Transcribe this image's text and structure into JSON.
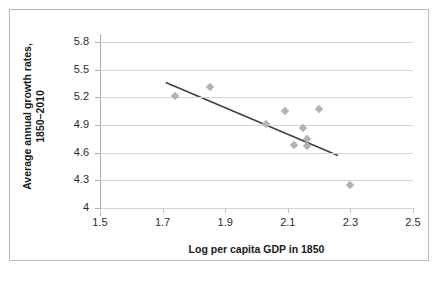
{
  "chart_data": {
    "type": "scatter",
    "title": "",
    "xlabel": "Log per capita GDP in 1850",
    "ylabel": "Average annual growth rates, 1850–2010",
    "ylabel_line1": "Average annual growth rates,",
    "ylabel_line2": "1850–2010",
    "xlim": [
      1.5,
      2.5
    ],
    "ylim": [
      4.0,
      5.8
    ],
    "xticks": [
      "1.5",
      "1.7",
      "1.9",
      "2.1",
      "2.3",
      "2.5"
    ],
    "xtick_values": [
      1.5,
      1.7,
      1.9,
      2.1,
      2.3,
      2.5
    ],
    "yticks": [
      "4",
      "4.3",
      "4.6",
      "4.9",
      "5.2",
      "5.5",
      "5.8"
    ],
    "ytick_values": [
      4.0,
      4.3,
      4.6,
      4.9,
      5.2,
      5.5,
      5.8
    ],
    "grid": "horizontal",
    "legend": "none",
    "marker_shape": "diamond",
    "marker_color": "#b3b3b3",
    "trendline_color": "#404040",
    "points": [
      {
        "x": 1.74,
        "y": 5.21
      },
      {
        "x": 1.85,
        "y": 5.31
      },
      {
        "x": 2.03,
        "y": 4.91
      },
      {
        "x": 2.09,
        "y": 5.05
      },
      {
        "x": 2.12,
        "y": 4.68
      },
      {
        "x": 2.15,
        "y": 4.87
      },
      {
        "x": 2.16,
        "y": 4.75
      },
      {
        "x": 2.16,
        "y": 4.67
      },
      {
        "x": 2.2,
        "y": 5.07
      },
      {
        "x": 2.3,
        "y": 4.25
      }
    ],
    "trendline": {
      "x1": 1.71,
      "y1": 5.36,
      "x2": 2.26,
      "y2": 4.57
    }
  }
}
